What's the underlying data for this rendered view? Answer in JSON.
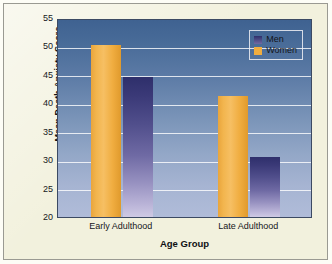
{
  "chart_data": {
    "type": "bar",
    "title": "",
    "subtitle": "",
    "xlabel": "Age Group",
    "ylabel": "Mean Death Anxiety Score",
    "categories": [
      "Early Adulthood",
      "Late Adulthood"
    ],
    "series": [
      {
        "name": "Men",
        "values": [
          44.7,
          30.5
        ],
        "color": "#3b3a78"
      },
      {
        "name": "Women",
        "values": [
          50.3,
          41.3
        ],
        "color": "#f0ad40"
      }
    ],
    "series_order_drawn": [
      "Women",
      "Men"
    ],
    "ylim": [
      20,
      55
    ],
    "yticks": [
      20,
      25,
      30,
      35,
      40,
      45,
      50,
      55
    ],
    "ytick_labels": [
      "20",
      "25",
      "30",
      "35",
      "40",
      "45",
      "50",
      "55"
    ],
    "grid": "horizontal",
    "legend_position": "top-right",
    "legend_entries": [
      "Men",
      "Women"
    ],
    "annotations": []
  },
  "axes": {
    "y_title": "Mean Death Anxiety Score",
    "x_title": "Age Group",
    "y_tick_labels": [
      "55",
      "50",
      "45",
      "40",
      "35",
      "30",
      "25",
      "20"
    ],
    "x_tick_labels": [
      "Early Adulthood",
      "Late Adulthood"
    ]
  },
  "legend": {
    "items": [
      {
        "label": "Men",
        "color": "#3b3a78"
      },
      {
        "label": "Women",
        "color": "#f0ad40"
      }
    ]
  },
  "colors": {
    "panel_background": "#f2f1dd",
    "plot_top": "#3f6291",
    "plot_bottom": "#b0bcd9",
    "gridline": "#ffffff",
    "men_bar": "#3b3a78",
    "women_bar": "#f0ad40",
    "frame_border": "#9a9a92",
    "text": "#16171c"
  }
}
